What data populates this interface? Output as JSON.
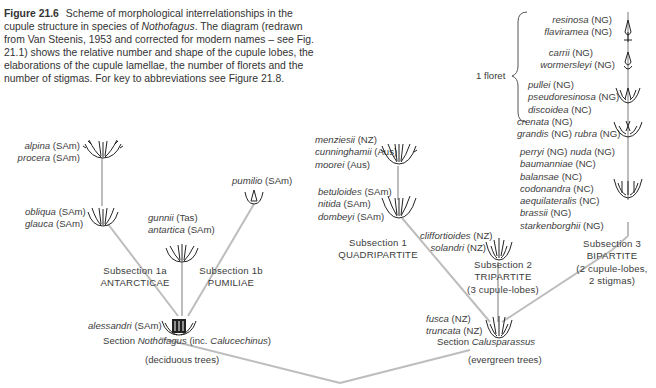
{
  "caption": {
    "figure_label": "Figure 21.6",
    "text_before_genus": "Scheme of morphological interrelationships in the cupule structure in species of ",
    "genus": "Nothofagus",
    "text_after_genus": ". The diagram (redrawn from Van Steenis, 1953 and corrected for modern names – see Fig. 21.1) shows the relative number and shape of the cupule lobes, the elaborations of the cupule lamellae, the number of florets and the number of stigmas. For key to abbreviations see Figure 21.8."
  },
  "brace_label": "1 floret",
  "groups": {
    "resinosa": [
      {
        "sp": "resinosa",
        "reg": "(NG)"
      },
      {
        "sp": "flaviramea",
        "reg": "(NG)"
      }
    ],
    "carrii": [
      {
        "sp": "carrii",
        "reg": "(NG)"
      },
      {
        "sp": "wormersleyi",
        "reg": "(NG)"
      }
    ],
    "pullei": [
      {
        "sp": "pullei",
        "reg": "(NG)"
      },
      {
        "sp": "pseudoresinosa",
        "reg": "(NG)"
      },
      {
        "sp": "discoidea",
        "reg": "(NC)"
      }
    ],
    "crenata": [
      {
        "sp": "crenata",
        "reg": "(NG)"
      },
      {
        "sp": "grandis",
        "reg": "(NG)",
        "sp2": "rubra",
        "reg2": "(NG)"
      }
    ],
    "perryi": [
      {
        "sp": "perryi",
        "reg": "(NG)",
        "sp2": "nuda",
        "reg2": "(NG)"
      },
      {
        "sp": "baumanniae",
        "reg": "(NC)"
      },
      {
        "sp": "balansae",
        "reg": "(NC)"
      },
      {
        "sp": "codonandra",
        "reg": "(NC)"
      },
      {
        "sp": "aequilateralis",
        "reg": "(NC)"
      },
      {
        "sp": "brassii",
        "reg": "(NG)"
      },
      {
        "sp": "starkenborghii",
        "reg": "(NG)"
      }
    ],
    "menziesii": [
      {
        "sp": "menziesii",
        "reg": "(NZ)"
      },
      {
        "sp": "cunninghamii",
        "reg": "(Aus)"
      },
      {
        "sp": "moorei",
        "reg": "(Aus)"
      }
    ],
    "betuloides": [
      {
        "sp": "betuloides",
        "reg": "(SAm)"
      },
      {
        "sp": "nitida",
        "reg": "(SAm)"
      },
      {
        "sp": "dombeyi",
        "reg": "(SAm)"
      }
    ],
    "cliffortioides": [
      {
        "sp": "cliffortioides",
        "reg": "(NZ)"
      },
      {
        "sp": "solandri",
        "reg": "(NZ)"
      }
    ],
    "fusca": [
      {
        "sp": "fusca",
        "reg": "(NZ)"
      },
      {
        "sp": "truncata",
        "reg": "(NZ)"
      }
    ],
    "alpina": [
      {
        "sp": "alpina",
        "reg": "(SAm)"
      },
      {
        "sp": "procera",
        "reg": "(SAm)"
      }
    ],
    "obliqua": [
      {
        "sp": "obliqua",
        "reg": "(SAm)"
      },
      {
        "sp": "glauca",
        "reg": "(SAm)"
      }
    ],
    "gunnii": [
      {
        "sp": "gunnii",
        "reg": "(Tas)"
      },
      {
        "sp": "antartica",
        "reg": "(SAm)"
      }
    ],
    "pumilio": [
      {
        "sp": "pumilio",
        "reg": "(SAm)"
      }
    ],
    "alessandri": [
      {
        "sp": "alessandri",
        "reg": "(SAm)"
      }
    ]
  },
  "subsections": {
    "s1a": {
      "line1": "Subsection 1a",
      "line2": "ANTARCTICAE"
    },
    "s1b": {
      "line1": "Subsection 1b",
      "line2": "PUMILIAE"
    },
    "s1": {
      "line1": "Subsection 1",
      "line2": "QUADRIPARTITE"
    },
    "s2": {
      "line1": "Subsection 2",
      "line2": "TRIPARTITE",
      "line3": "(3 cupule-lobes)"
    },
    "s3": {
      "line1": "Subsection 3",
      "line2": "BIPARTITE",
      "line3": "(2 cupule-lobes,",
      "line4": "2 stigmas)"
    }
  },
  "sections": {
    "nothofagus": {
      "prefix": "Section ",
      "name": "Nothofagus",
      "mid": " (inc. ",
      "name2": "Calucechinus",
      "suffix": ")",
      "habit": "(deciduous trees)"
    },
    "calusparassus": {
      "prefix": "Section ",
      "name": "Calusparassus",
      "habit": "(evergreen trees)"
    }
  },
  "colors": {
    "line": "#bdbdbd",
    "text": "#3c3c3c",
    "icon": "#1e1e1e"
  }
}
